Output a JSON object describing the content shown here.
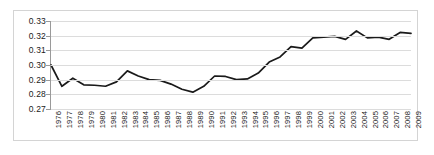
{
  "chart_data": {
    "type": "line",
    "title": "",
    "subtitle": "",
    "xlabel": "",
    "ylabel": "",
    "grid": true,
    "legend": false,
    "legend_position": "none",
    "line_color": "#1a1a1a",
    "gridline_color": "#dcdcdc",
    "axis_color": "#9a9a9a",
    "background_color": "#ffffff",
    "border_color": "#d4d4d4",
    "xlim": [
      1976,
      2009
    ],
    "ylim": [
      0.27,
      0.33
    ],
    "y_ticks": [
      "0.33",
      "0.32",
      "0.31",
      "0.30",
      "0.29",
      "0.28",
      "0.27"
    ],
    "y_tick_values": [
      0.33,
      0.32,
      0.31,
      0.3,
      0.29,
      0.28,
      0.27
    ],
    "categories": [
      "1976",
      "1977",
      "1978",
      "1979",
      "1980",
      "1981",
      "1982",
      "1983",
      "1984",
      "1985",
      "1986",
      "1987",
      "1988",
      "1989",
      "1990",
      "1991",
      "1992",
      "1993",
      "1994",
      "1995",
      "1996",
      "1997",
      "1998",
      "1999",
      "2000",
      "2001",
      "2002",
      "2003",
      "2004",
      "2005",
      "2006",
      "2007",
      "2008",
      "2009"
    ],
    "values": [
      0.3,
      0.2855,
      0.291,
      0.2865,
      0.2862,
      0.2855,
      0.2885,
      0.296,
      0.2925,
      0.29,
      0.2895,
      0.287,
      0.2835,
      0.2815,
      0.2855,
      0.2925,
      0.2922,
      0.29,
      0.2905,
      0.2945,
      0.302,
      0.3055,
      0.3125,
      0.3115,
      0.3185,
      0.319,
      0.3195,
      0.3175,
      0.3232,
      0.3185,
      0.319,
      0.3175,
      0.3222,
      0.3215
    ],
    "series": [
      {
        "name": "series-1",
        "values": [
          0.3,
          0.2855,
          0.291,
          0.2865,
          0.2862,
          0.2855,
          0.2885,
          0.296,
          0.2925,
          0.29,
          0.2895,
          0.287,
          0.2835,
          0.2815,
          0.2855,
          0.2925,
          0.2922,
          0.29,
          0.2905,
          0.2945,
          0.302,
          0.3055,
          0.3125,
          0.3115,
          0.3185,
          0.319,
          0.3195,
          0.3175,
          0.3232,
          0.3185,
          0.319,
          0.3175,
          0.3222,
          0.3215
        ]
      }
    ]
  }
}
